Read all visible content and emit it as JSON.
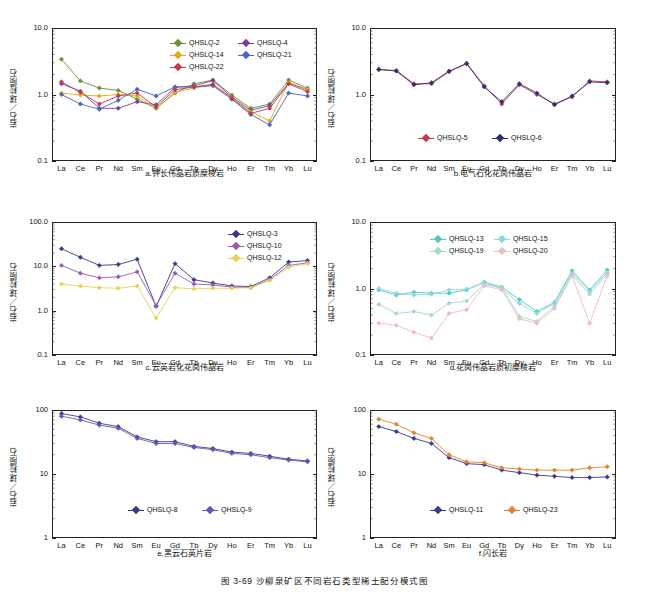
{
  "figure": {
    "caption": "图 3-69  沙柳泉矿区不同岩石类型稀土配分模式图"
  },
  "axis": {
    "ylabel": "岩石／球粒陨石",
    "elements": [
      "La",
      "Ce",
      "Pr",
      "Nd",
      "Sm",
      "Eu",
      "Gd",
      "Tb",
      "Dy",
      "Ho",
      "Er",
      "Tm",
      "Yb",
      "Lu"
    ]
  },
  "chart_data": [
    {
      "id": "a",
      "type": "line",
      "title": "a.钾长伟晶岩质糜棱岩",
      "xlabel": "",
      "ylabel": "岩石／球粒陨石",
      "categories": [
        "La",
        "Ce",
        "Pr",
        "Nd",
        "Sm",
        "Eu",
        "Gd",
        "Tb",
        "Dy",
        "Ho",
        "Er",
        "Tm",
        "Yb",
        "Lu"
      ],
      "yticks": [
        "0.1",
        "1.0",
        "10.0"
      ],
      "ylim": [
        0.1,
        10.0
      ],
      "log": true,
      "grid": false,
      "legend_position": "top-center",
      "series": [
        {
          "name": "QHSLQ-2",
          "color": "#6b8f3a",
          "marker": "diamond",
          "values": [
            3.4,
            1.6,
            1.25,
            1.15,
            0.85,
            0.62,
            1.05,
            1.45,
            1.65,
            0.98,
            0.62,
            0.72,
            1.65,
            1.25
          ]
        },
        {
          "name": "QHSLQ-4",
          "color": "#7b3fa0",
          "marker": "diamond",
          "values": [
            1.45,
            1.12,
            0.62,
            0.62,
            0.78,
            0.7,
            1.28,
            1.35,
            1.62,
            0.92,
            0.58,
            0.68,
            1.48,
            1.18
          ]
        },
        {
          "name": "QHSLQ-14",
          "color": "#e0a81c",
          "marker": "diamond",
          "values": [
            1.05,
            0.98,
            0.95,
            1.0,
            0.95,
            0.62,
            1.08,
            1.25,
            1.4,
            0.9,
            0.55,
            0.4,
            1.52,
            1.2
          ]
        },
        {
          "name": "QHSLQ-21",
          "color": "#4a63c8",
          "marker": "diamond",
          "values": [
            1.0,
            0.72,
            0.6,
            0.82,
            1.2,
            0.95,
            1.3,
            1.3,
            1.35,
            0.85,
            0.5,
            0.35,
            1.05,
            0.95
          ]
        },
        {
          "name": "QHSLQ-22",
          "color": "#c23a4a",
          "marker": "diamond",
          "values": [
            1.55,
            1.08,
            0.72,
            0.95,
            1.05,
            0.65,
            1.18,
            1.3,
            1.42,
            0.88,
            0.52,
            0.62,
            1.45,
            1.1
          ]
        }
      ]
    },
    {
      "id": "b",
      "type": "line",
      "title": "b.电气石化花岗伟晶岩",
      "xlabel": "",
      "ylabel": "岩石／球粒陨石",
      "categories": [
        "La",
        "Ce",
        "Pr",
        "Nd",
        "Sm",
        "Eu",
        "Gd",
        "Tb",
        "Dy",
        "Ho",
        "Er",
        "Tm",
        "Yb",
        "Lu"
      ],
      "yticks": [
        "0.1",
        "1.0",
        "10.0"
      ],
      "ylim": [
        0.1,
        10.0
      ],
      "log": true,
      "grid": false,
      "legend_position": "bottom-center",
      "series": [
        {
          "name": "QHSLQ-5",
          "color": "#c23a4a",
          "marker": "diamond",
          "values": [
            2.35,
            2.3,
            1.45,
            1.45,
            2.2,
            2.95,
            1.35,
            0.72,
            1.4,
            1.0,
            0.72,
            0.92,
            1.6,
            1.55
          ]
        },
        {
          "name": "QHSLQ-6",
          "color": "#2e2e7a",
          "marker": "diamond",
          "values": [
            2.4,
            2.25,
            1.4,
            1.5,
            2.25,
            2.9,
            1.3,
            0.78,
            1.45,
            1.05,
            0.7,
            0.95,
            1.55,
            1.5
          ]
        }
      ]
    },
    {
      "id": "c",
      "type": "line",
      "title": "c.云英岩化花岗伟晶岩",
      "xlabel": "",
      "ylabel": "岩石／球粒陨石",
      "categories": [
        "La",
        "Ce",
        "Pr",
        "Nd",
        "Sm",
        "Eu",
        "Gd",
        "Tb",
        "Dy",
        "Ho",
        "Er",
        "Tm",
        "Yb",
        "Lu"
      ],
      "yticks": [
        "0.1",
        "1.0",
        "10.0",
        "100.0"
      ],
      "ylim": [
        0.1,
        100.0
      ],
      "log": true,
      "grid": false,
      "legend_position": "top-right",
      "series": [
        {
          "name": "QHSLQ-3",
          "color": "#3a3a8c",
          "marker": "diamond",
          "values": [
            25.0,
            16.0,
            10.5,
            11.0,
            14.5,
            1.25,
            11.5,
            5.0,
            4.2,
            3.6,
            3.5,
            5.5,
            12.5,
            13.5
          ]
        },
        {
          "name": "QHSLQ-10",
          "color": "#9a5ab5",
          "marker": "diamond",
          "values": [
            10.5,
            7.0,
            5.5,
            5.8,
            7.5,
            1.3,
            7.0,
            4.0,
            3.8,
            3.4,
            3.3,
            5.0,
            10.5,
            12.0
          ]
        },
        {
          "name": "QHSLQ-12",
          "color": "#e8d24a",
          "marker": "diamond",
          "values": [
            4.0,
            3.6,
            3.3,
            3.2,
            3.6,
            0.68,
            3.3,
            3.1,
            3.2,
            3.2,
            3.3,
            4.8,
            9.5,
            11.5
          ]
        }
      ]
    },
    {
      "id": "d",
      "type": "line",
      "title": "d.花岗伟晶岩质初糜棱岩",
      "xlabel": "",
      "ylabel": "岩石／球粒陨石",
      "categories": [
        "La",
        "Ce",
        "Pr",
        "Nd",
        "Sm",
        "Eu",
        "Gd",
        "Tb",
        "Dy",
        "Ho",
        "Er",
        "Tm",
        "Yb",
        "Lu"
      ],
      "yticks": [
        "0.1",
        "1.0",
        "10.0"
      ],
      "ylim": [
        0.1,
        10.0
      ],
      "log": true,
      "grid": false,
      "legend_position": "top-center",
      "series": [
        {
          "name": "QHSLQ-13",
          "color": "#4ec9c0",
          "marker": "diamond",
          "values": [
            0.95,
            0.8,
            0.88,
            0.85,
            0.85,
            0.95,
            1.25,
            1.05,
            0.68,
            0.45,
            0.62,
            1.85,
            0.95,
            1.9
          ]
        },
        {
          "name": "QHSLQ-15",
          "color": "#8fd6e8",
          "marker": "diamond",
          "values": [
            1.0,
            0.85,
            0.8,
            0.82,
            0.95,
            0.98,
            1.22,
            0.98,
            0.6,
            0.42,
            0.6,
            1.7,
            0.9,
            1.75
          ]
        },
        {
          "name": "QHSLQ-19",
          "color": "#a8d8c8",
          "marker": "diamond",
          "values": [
            0.58,
            0.42,
            0.45,
            0.4,
            0.6,
            0.65,
            1.15,
            1.02,
            0.38,
            0.32,
            0.55,
            1.6,
            0.82,
            1.65
          ]
        },
        {
          "name": "QHSLQ-20",
          "color": "#f2b8c8",
          "marker": "diamond",
          "values": [
            0.3,
            0.28,
            0.22,
            0.18,
            0.42,
            0.48,
            1.1,
            0.95,
            0.35,
            0.3,
            0.5,
            1.55,
            0.3,
            1.55
          ]
        }
      ]
    },
    {
      "id": "e",
      "type": "line",
      "title": "e.黑云石英片岩",
      "xlabel": "",
      "ylabel": "岩石／球粒陨石",
      "categories": [
        "La",
        "Ce",
        "Pr",
        "Nd",
        "Sm",
        "Eu",
        "Gd",
        "Tb",
        "Dy",
        "Ho",
        "Er",
        "Tm",
        "Yb",
        "Lu"
      ],
      "yticks": [
        "1",
        "10",
        "100"
      ],
      "ylim": [
        1,
        100
      ],
      "log": true,
      "grid": false,
      "legend_position": "bottom-center",
      "series": [
        {
          "name": "QHSLQ-8",
          "color": "#3a3a8c",
          "marker": "diamond",
          "values": [
            88,
            78,
            62,
            55,
            38,
            32,
            32,
            27,
            25,
            22,
            21,
            19,
            17,
            16
          ]
        },
        {
          "name": "QHSLQ-9",
          "color": "#5a5ab5",
          "marker": "diamond",
          "values": [
            80,
            70,
            58,
            52,
            36,
            30,
            30,
            26,
            24,
            21,
            20,
            18,
            16.5,
            15.5
          ]
        }
      ]
    },
    {
      "id": "f",
      "type": "line",
      "title": "f.闪长岩",
      "xlabel": "",
      "ylabel": "岩石／球粒陨石",
      "categories": [
        "La",
        "Ce",
        "Pr",
        "Nd",
        "Sm",
        "Eu",
        "Gd",
        "Tb",
        "Dy",
        "Ho",
        "Er",
        "Tm",
        "Yb",
        "Lu"
      ],
      "yticks": [
        "1",
        "10",
        "100"
      ],
      "ylim": [
        1,
        100
      ],
      "log": true,
      "grid": false,
      "legend_position": "bottom-center",
      "series": [
        {
          "name": "QHSLQ-11",
          "color": "#3a3a8c",
          "marker": "diamond",
          "values": [
            55,
            46,
            36,
            30,
            18,
            14.5,
            14,
            11.5,
            10.5,
            9.6,
            9.2,
            8.8,
            8.8,
            9.0
          ]
        },
        {
          "name": "QHSLQ-23",
          "color": "#e8812a",
          "marker": "diamond",
          "values": [
            72,
            60,
            44,
            36,
            20,
            15.5,
            15,
            12.5,
            12,
            11.5,
            11.5,
            11.5,
            12.5,
            13.0
          ]
        }
      ]
    }
  ]
}
